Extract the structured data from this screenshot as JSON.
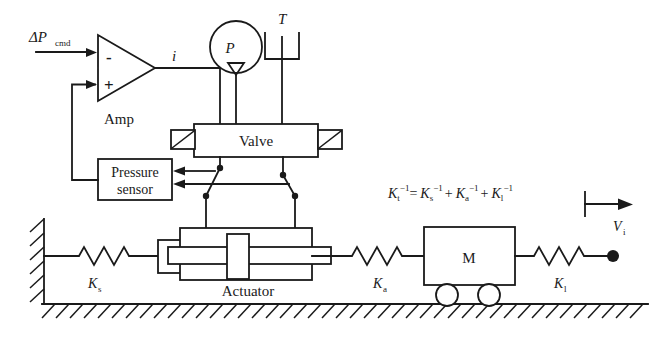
{
  "diagram": {
    "canvas": {
      "width": 668,
      "height": 350
    },
    "colors": {
      "ink": "#1a1a1a",
      "paper": "#ffffff"
    }
  },
  "labels": {
    "command_input": "ΔP",
    "command_input_sub": "cmd",
    "amp_minus": "-",
    "amp_plus": "+",
    "amp_name": "Amp",
    "current_signal": "i",
    "pressure_supply": "P",
    "tank_return": "T",
    "valve": "Valve",
    "pressure_sensor_line1": "Pressure",
    "pressure_sensor_line2": "sensor",
    "actuator": "Actuator",
    "mass": "M",
    "spring_structure": "K",
    "spring_structure_sub": "s",
    "spring_actuator": "K",
    "spring_actuator_sub": "a",
    "spring_load": "K",
    "spring_load_sub": "l",
    "velocity": "V",
    "velocity_sub": "i"
  },
  "equation": {
    "full": "Kt^-1 = Ks^-1 + Ka^-1 + Kl^-1",
    "lhs_base": "K",
    "lhs_sub": "t",
    "exp": "−1",
    "eq": "=",
    "term1_base": "K",
    "term1_sub": "s",
    "plus1": "+",
    "term2_base": "K",
    "term2_sub": "a",
    "plus2": "+",
    "term3_base": "K",
    "term3_sub": "l"
  },
  "components": [
    {
      "name": "amplifier",
      "type": "triangle",
      "label": "Amp"
    },
    {
      "name": "pressure-supply",
      "type": "pump-circle",
      "label": "P"
    },
    {
      "name": "tank-return",
      "type": "reservoir",
      "label": "T"
    },
    {
      "name": "valve",
      "type": "spool-valve",
      "label": "Valve"
    },
    {
      "name": "pressure-sensor",
      "type": "box",
      "label": "Pressure sensor"
    },
    {
      "name": "actuator",
      "type": "hydraulic-cylinder",
      "label": "Actuator"
    },
    {
      "name": "mass-cart",
      "type": "mass-on-wheels",
      "label": "M"
    },
    {
      "name": "spring-structure",
      "type": "spring",
      "label": "Ks"
    },
    {
      "name": "spring-actuator",
      "type": "spring",
      "label": "Ka"
    },
    {
      "name": "spring-load",
      "type": "spring",
      "label": "Kl"
    },
    {
      "name": "ground",
      "type": "hatched-ground",
      "label": ""
    },
    {
      "name": "wall",
      "type": "hatched-wall",
      "label": ""
    }
  ]
}
